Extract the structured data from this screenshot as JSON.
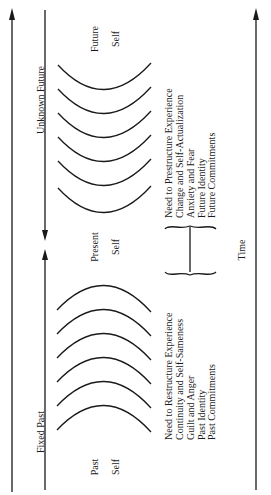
{
  "diagram": {
    "orientation": "rotated-90-ccw",
    "axis_labels": {
      "unknown_future": "Unknown Future",
      "fixed_past": "Fixed Past",
      "time": "Time"
    },
    "selves": {
      "future": [
        "Future",
        "Self"
      ],
      "present": [
        "Present",
        "Self"
      ],
      "past": [
        "Past",
        "Self"
      ]
    },
    "future_list": [
      "Need to Prestructure Experience",
      "Change and Self-Actualization",
      "Anxiety and Fear",
      "Future Identity",
      "Future Commitments"
    ],
    "past_list": [
      "Need to Restructure Experience",
      "Continuity and Self-Sameness",
      "Guilt and Anger",
      "Past Identity",
      "Past Commitments"
    ],
    "future_arc_count": 6,
    "past_arc_count": 6,
    "line_color": "#1a1a1a"
  }
}
